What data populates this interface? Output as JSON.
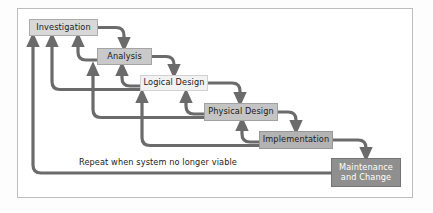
{
  "diagram": {
    "type": "waterfall-sdlc-flowchart",
    "frame": {
      "border_color": "#bdbdbd",
      "background": "#ffffff"
    },
    "arrow_color": "#6b6b6b",
    "arrow_width": 3.2,
    "nodes": [
      {
        "id": "investigation",
        "label": "Investigation",
        "x": 29,
        "y": 19,
        "w": 69,
        "h": 17,
        "fill": "#d8d8d8",
        "text_color": "#1b1b1b"
      },
      {
        "id": "analysis",
        "label": "Analysis",
        "x": 97,
        "y": 48,
        "w": 55,
        "h": 17,
        "fill": "#c9c9c9",
        "text_color": "#1b1b1b"
      },
      {
        "id": "logical-design",
        "label": "Logical Design",
        "x": 140,
        "y": 75,
        "w": 68,
        "h": 16,
        "fill": "#f2f2f2",
        "text_color": "#1b1b1b"
      },
      {
        "id": "physical-design",
        "label": "Physical Design",
        "x": 204,
        "y": 103,
        "w": 74,
        "h": 18,
        "fill": "#c4c4c4",
        "text_color": "#1b1b1b"
      },
      {
        "id": "implementation",
        "label": "Implementation",
        "x": 259,
        "y": 131,
        "w": 74,
        "h": 18,
        "fill": "#b3b3b3",
        "text_color": "#1b1b1b"
      },
      {
        "id": "maintenance-and-change",
        "label": "Maintenance\nand Change",
        "x": 331,
        "y": 158,
        "w": 70,
        "h": 29,
        "fill": "#8f8f8f",
        "text_color": "#ffffff"
      }
    ],
    "caption": {
      "text": "Repeat when system no longer viable",
      "x": 79,
      "y": 157
    },
    "forward_flow": [
      "Investigation",
      "Analysis",
      "Logical Design",
      "Physical Design",
      "Implementation",
      "Maintenance and Change"
    ],
    "feedback_flow": [
      "Analysis back to Investigation",
      "Logical Design back to Analysis",
      "Physical Design back to Logical Design",
      "Implementation back to Physical Design",
      "Maintenance and Change back to Investigation"
    ]
  }
}
